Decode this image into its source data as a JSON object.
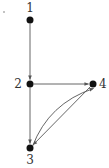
{
  "diagram": {
    "type": "directed-graph",
    "stroke_color": "#555555",
    "node_color": "#111111",
    "stray_dot": {
      "x": 4,
      "y": 12
    },
    "nodes": [
      {
        "id": "1",
        "label": "1",
        "x": 30,
        "y": 20,
        "label_x": 30,
        "label_y": 12,
        "anchor": "middle"
      },
      {
        "id": "2",
        "label": "2",
        "x": 30,
        "y": 84,
        "label_x": 22,
        "label_y": 88,
        "anchor": "end"
      },
      {
        "id": "4",
        "label": "4",
        "x": 93,
        "y": 84,
        "label_x": 99,
        "label_y": 88,
        "anchor": "start"
      },
      {
        "id": "3",
        "label": "3",
        "x": 30,
        "y": 148,
        "label_x": 30,
        "label_y": 164,
        "anchor": "middle"
      }
    ],
    "edges": [
      {
        "from": "1",
        "to": "2",
        "curved": false
      },
      {
        "from": "2",
        "to": "4",
        "curved": false
      },
      {
        "from": "2",
        "to": "3",
        "curved": false
      },
      {
        "from": "4",
        "to": "3",
        "curved": false
      },
      {
        "from": "3",
        "to": "4",
        "curved": true
      }
    ]
  }
}
